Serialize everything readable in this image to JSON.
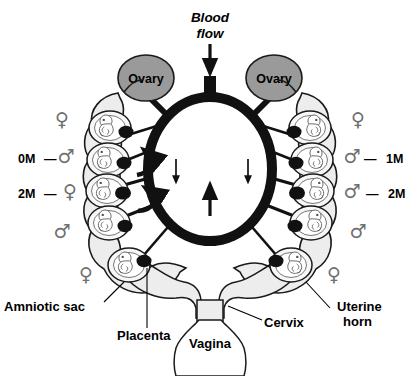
{
  "figure": {
    "type": "anatomical-diagram",
    "background_color": "#ffffff"
  },
  "colors": {
    "ovary_fill": "#9a9a9a",
    "uterus_fill": "#ededed",
    "sac_fill": "#f4f4f4",
    "vessel_black": "#111111",
    "placenta": "#111111",
    "sex_symbol": "#6f6f6f",
    "outline": "#1a1a1a"
  },
  "annotations": {
    "blood_flow": "Blood\nflow",
    "blood_flow_line1": "Blood",
    "blood_flow_line2": "flow",
    "ovary_left": "Ovary",
    "ovary_right": "Ovary",
    "amniotic_sac": "Amniotic sac",
    "placenta": "Placenta",
    "cervix": "Cervix",
    "vagina": "Vagina",
    "uterine_horn_line1": "Uterine",
    "uterine_horn_line2": "horn"
  },
  "icons": {
    "female": "♀",
    "male": "♂",
    "arrow_down": "arrow-down-icon",
    "arrow_up": "arrow-up-icon",
    "curved_arrow": "curved-arrow-icon"
  },
  "left_horn": {
    "label": "left uterine horn",
    "fetuses": [
      {
        "sex": "♀",
        "mark": "",
        "index": 1
      },
      {
        "sex": "♂",
        "mark": "0M",
        "index": 2
      },
      {
        "sex": "♀",
        "mark": "2M",
        "index": 3
      },
      {
        "sex": "♂",
        "mark": "",
        "index": 4
      },
      {
        "sex": "♀",
        "mark": "",
        "index": 5
      }
    ]
  },
  "right_horn": {
    "label": "right uterine horn",
    "fetuses": [
      {
        "sex": "♀",
        "mark": "",
        "index": 1
      },
      {
        "sex": "♂",
        "mark": "1M",
        "index": 2
      },
      {
        "sex": "♂",
        "mark": "2M",
        "index": 3
      },
      {
        "sex": "♂",
        "mark": "",
        "index": 4
      },
      {
        "sex": "♀",
        "mark": "",
        "index": 5
      }
    ]
  },
  "marks": {
    "zeroM": "0M",
    "oneM": "1M",
    "twoM_left": "2M",
    "twoM_right": "2M",
    "dash": "—"
  }
}
